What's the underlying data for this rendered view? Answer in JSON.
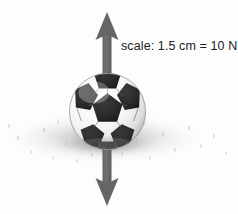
{
  "figure": {
    "name": "soccer-ball-force-vector-diagram",
    "background_color": "#fdfdfd"
  },
  "annotation": {
    "scale_text": "scale: 1.5 cm = 10 N",
    "text_color": "#201d1d"
  },
  "force_arrow": {
    "name": "vertical-double-headed-force-arrow",
    "color": "#666666",
    "shaft_color": "#6b6b6b",
    "direction": "double-headed-vertical",
    "top_tip_y": 12,
    "bottom_tip_y": 206,
    "center_x": 107,
    "shaft_width": 9,
    "head_width": 23
  },
  "ball": {
    "name": "soccer-ball",
    "panel_dark_color": "#2b2b2b",
    "panel_light_color": "#fbfbfb",
    "outline_color": "#9a9a9a",
    "center_x": 107,
    "center_y": 111,
    "diameter": 79
  },
  "shadow": {
    "name": "ground-shadow",
    "color": "#787878"
  }
}
